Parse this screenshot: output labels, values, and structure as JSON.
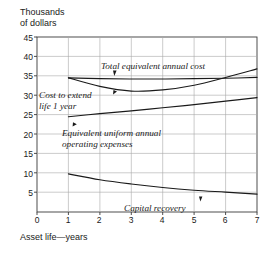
{
  "chart_data": {
    "type": "line",
    "title": "",
    "ylabel": "Thousands of dollars",
    "ylabel_line1": "Thousands",
    "ylabel_line2": "of dollars",
    "xlabel": "Asset life—years",
    "xlim": [
      0,
      7
    ],
    "ylim": [
      0,
      45
    ],
    "xticks": [
      "0",
      "1",
      "2",
      "3",
      "4",
      "5",
      "6",
      "7"
    ],
    "yticks": [
      "45",
      "40",
      "35",
      "30",
      "25",
      "20",
      "15",
      "10",
      "5"
    ],
    "grid": true,
    "legend": "none",
    "x": [
      1,
      2,
      3,
      4,
      5,
      6,
      7
    ],
    "series": [
      {
        "name": "Cost to extend life 1 year",
        "label": "Cost to extend\nlife 1 year",
        "label_line1": "Cost to extend",
        "label_line2": "life 1 year",
        "values": [
          34.5,
          34.3,
          34.2,
          34.2,
          34.3,
          34.4,
          34.6
        ],
        "color": "#1a1a1a"
      },
      {
        "name": "Total equivalent annual cost",
        "label": "Total equivalent annual cost",
        "values": [
          34.5,
          32.3,
          31.1,
          31.4,
          32.6,
          34.6,
          36.8
        ],
        "color": "#1a1a1a"
      },
      {
        "name": "Equivalent uniform annual operating expenses",
        "label": "Equivalent uniform annual\noperating expenses",
        "label_line1": "Equivalent uniform annual",
        "label_line2": "operating expenses",
        "values": [
          24.5,
          25.3,
          26.0,
          26.8,
          27.6,
          28.5,
          29.4
        ],
        "color": "#1a1a1a"
      },
      {
        "name": "Capital recovery",
        "label": "Capital recovery",
        "values": [
          9.8,
          8.3,
          7.2,
          6.3,
          5.6,
          5.1,
          4.6
        ],
        "color": "#1a1a1a"
      }
    ],
    "annotations": [
      {
        "text": "Total equivalent annual cost",
        "points_to_series": "Total equivalent annual cost",
        "at_x": 2.6
      },
      {
        "text": "Cost to extend life 1 year",
        "points_to_series": "Cost to extend life 1 year",
        "at_x": 2.6
      },
      {
        "text": "Equivalent uniform annual operating expenses",
        "points_to_series": "Equivalent uniform annual operating expenses",
        "at_x": 1.4
      },
      {
        "text": "Capital recovery",
        "points_to_series": "Capital recovery",
        "at_x": 5.2
      }
    ],
    "colors": {
      "axis": "#333333",
      "grid": "#aaaaaa",
      "curve": "#1a1a1a",
      "background": "#ffffff"
    }
  }
}
